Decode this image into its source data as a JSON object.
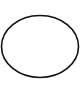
{
  "shape": {
    "type": "ellipse",
    "cx": 40,
    "cy": 46.5,
    "rx": 38.5,
    "ry": 31,
    "stroke": "#111111",
    "stroke_width": 1.6,
    "fill": "none"
  },
  "background": "#ffffff"
}
